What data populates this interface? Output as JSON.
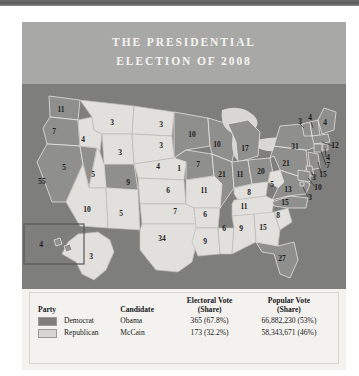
{
  "figure": {
    "title_line1": "THE PRESIDENTIAL",
    "title_line2": "ELECTION OF 2008"
  },
  "colors": {
    "democrat_swatch": "#7d7d7b",
    "republican_swatch": "#d8d6d2",
    "map_background": "#7e7e7c",
    "header_background": "#a8a8a6",
    "legend_background": "#f4f2ee",
    "title_text": "#f4f3f0"
  },
  "legend": {
    "headers": {
      "party": "Party",
      "candidate": "Candidate",
      "electoral_line1": "Electoral Vote",
      "electoral_line2": "(Share)",
      "popular_line1": "Popular Vote",
      "popular_line2": "(Share)"
    },
    "rows": [
      {
        "swatch": "democrat-swatch",
        "party": "Democrat",
        "candidate": "Obama",
        "electoral": "365 (67.8%)",
        "popular": "66,882,230 (53%)"
      },
      {
        "swatch": "republican-swatch",
        "party": "Republican",
        "candidate": "McCain",
        "electoral": "173 (32.2%)",
        "popular": "58,343,671 (46%)"
      }
    ]
  },
  "chart_data": {
    "type": "map",
    "title": "THE PRESIDENTIAL ELECTION OF 2008",
    "subtitle": "",
    "legend_position": "bottom",
    "categories": [
      "Democrat",
      "Republican"
    ],
    "series": [
      {
        "name": "Democrat",
        "candidate": "Obama",
        "electoral_votes": 365,
        "electoral_share": "67.8%",
        "popular_votes": "66,882,230",
        "popular_share": "53%",
        "color": "#7d7d7b"
      },
      {
        "name": "Republican",
        "candidate": "McCain",
        "electoral_votes": 173,
        "electoral_share": "32.2%",
        "popular_votes": "58,343,671",
        "popular_share": "46%",
        "color": "#d8d6d2"
      }
    ],
    "states": [
      {
        "code": "WA",
        "electoral_votes": 11,
        "winner": "Democrat",
        "x": 39,
        "y": 26
      },
      {
        "code": "OR",
        "electoral_votes": 7,
        "winner": "Democrat",
        "x": 32,
        "y": 48
      },
      {
        "code": "CA",
        "electoral_votes": 55,
        "winner": "Democrat",
        "x": 20,
        "y": 98
      },
      {
        "code": "NV",
        "electoral_votes": 5,
        "winner": "Democrat",
        "x": 42,
        "y": 84
      },
      {
        "code": "ID",
        "electoral_votes": 4,
        "winner": "Republican",
        "x": 61,
        "y": 56
      },
      {
        "code": "MT",
        "electoral_votes": 3,
        "winner": "Republican",
        "x": 90,
        "y": 39
      },
      {
        "code": "WY",
        "electoral_votes": 3,
        "winner": "Republican",
        "x": 98,
        "y": 69
      },
      {
        "code": "UT",
        "electoral_votes": 5,
        "winner": "Republican",
        "x": 71,
        "y": 91
      },
      {
        "code": "AZ",
        "electoral_votes": 10,
        "winner": "Republican",
        "x": 65,
        "y": 126
      },
      {
        "code": "NM",
        "electoral_votes": 5,
        "winner": "Republican",
        "x": 99,
        "y": 130
      },
      {
        "code": "CO",
        "electoral_votes": 9,
        "winner": "Democrat",
        "x": 106,
        "y": 99
      },
      {
        "code": "ND",
        "electoral_votes": 3,
        "winner": "Republican",
        "x": 139,
        "y": 41
      },
      {
        "code": "SD",
        "electoral_votes": 3,
        "winner": "Republican",
        "x": 139,
        "y": 62
      },
      {
        "code": "NE",
        "electoral_votes": 4,
        "winner": "Republican",
        "x": 136,
        "y": 83
      },
      {
        "code": "NE2",
        "electoral_votes": 1,
        "winner": "Democrat",
        "x": 157,
        "y": 85
      },
      {
        "code": "KS",
        "electoral_votes": 6,
        "winner": "Republican",
        "x": 146,
        "y": 107
      },
      {
        "code": "OK",
        "electoral_votes": 7,
        "winner": "Republican",
        "x": 153,
        "y": 128
      },
      {
        "code": "TX",
        "electoral_votes": 34,
        "winner": "Republican",
        "x": 140,
        "y": 155
      },
      {
        "code": "MN",
        "electoral_votes": 10,
        "winner": "Democrat",
        "x": 170,
        "y": 51
      },
      {
        "code": "IA",
        "electoral_votes": 7,
        "winner": "Democrat",
        "x": 176,
        "y": 81
      },
      {
        "code": "MO",
        "electoral_votes": 11,
        "winner": "Republican",
        "x": 182,
        "y": 107
      },
      {
        "code": "AR",
        "electoral_votes": 6,
        "winner": "Republican",
        "x": 183,
        "y": 131
      },
      {
        "code": "LA",
        "electoral_votes": 9,
        "winner": "Republican",
        "x": 183,
        "y": 158
      },
      {
        "code": "WI",
        "electoral_votes": 10,
        "winner": "Democrat",
        "x": 195,
        "y": 61
      },
      {
        "code": "IL",
        "electoral_votes": 21,
        "winner": "Democrat",
        "x": 200,
        "y": 91
      },
      {
        "code": "MS",
        "electoral_votes": 6,
        "winner": "Republican",
        "x": 202,
        "y": 145
      },
      {
        "code": "MI",
        "electoral_votes": 17,
        "winner": "Democrat",
        "x": 223,
        "y": 65
      },
      {
        "code": "IN",
        "electoral_votes": 11,
        "winner": "Democrat",
        "x": 218,
        "y": 91
      },
      {
        "code": "KY",
        "electoral_votes": 8,
        "winner": "Republican",
        "x": 227,
        "y": 109
      },
      {
        "code": "TN",
        "electoral_votes": 11,
        "winner": "Republican",
        "x": 222,
        "y": 123
      },
      {
        "code": "AL",
        "electoral_votes": 9,
        "winner": "Republican",
        "x": 219,
        "y": 145
      },
      {
        "code": "OH",
        "electoral_votes": 20,
        "winner": "Democrat",
        "x": 239,
        "y": 88
      },
      {
        "code": "GA",
        "electoral_votes": 15,
        "winner": "Republican",
        "x": 241,
        "y": 144
      },
      {
        "code": "FL",
        "electoral_votes": 27,
        "winner": "Democrat",
        "x": 260,
        "y": 175
      },
      {
        "code": "SC",
        "electoral_votes": 8,
        "winner": "Republican",
        "x": 256,
        "y": 132
      },
      {
        "code": "NC",
        "electoral_votes": 15,
        "winner": "Democrat",
        "x": 263,
        "y": 119
      },
      {
        "code": "WV",
        "electoral_votes": 5,
        "winner": "Republican",
        "x": 250,
        "y": 101
      },
      {
        "code": "VA",
        "electoral_votes": 13,
        "winner": "Democrat",
        "x": 266,
        "y": 106
      },
      {
        "code": "PA",
        "electoral_votes": 21,
        "winner": "Democrat",
        "x": 264,
        "y": 80
      },
      {
        "code": "NY",
        "electoral_votes": 31,
        "winner": "Democrat",
        "x": 273,
        "y": 63
      },
      {
        "code": "VT",
        "electoral_votes": 3,
        "winner": "Democrat",
        "x": 278,
        "y": 38
      },
      {
        "code": "NH",
        "electoral_votes": 4,
        "winner": "Democrat",
        "x": 288,
        "y": 34
      },
      {
        "code": "ME",
        "electoral_votes": 4,
        "winner": "Democrat",
        "x": 303,
        "y": 39
      },
      {
        "code": "MA",
        "electoral_votes": 12,
        "winner": "Democrat",
        "x": 313,
        "y": 62
      },
      {
        "code": "RI",
        "electoral_votes": 4,
        "winner": "Democrat",
        "x": 306,
        "y": 74
      },
      {
        "code": "CT",
        "electoral_votes": 7,
        "winner": "Democrat",
        "x": 306,
        "y": 82
      },
      {
        "code": "NJ",
        "electoral_votes": 15,
        "winner": "Democrat",
        "x": 301,
        "y": 91
      },
      {
        "code": "DE",
        "electoral_votes": 3,
        "winner": "Democrat",
        "x": 292,
        "y": 94
      },
      {
        "code": "MD",
        "electoral_votes": 10,
        "winner": "Democrat",
        "x": 296,
        "y": 104
      },
      {
        "code": "DC",
        "electoral_votes": 3,
        "winner": "Democrat",
        "x": 288,
        "y": 114
      },
      {
        "code": "AK",
        "electoral_votes": 3,
        "winner": "Republican",
        "x": 69,
        "y": 173
      },
      {
        "code": "HI",
        "electoral_votes": 4,
        "winner": "Democrat",
        "x": 19,
        "y": 161
      }
    ]
  }
}
